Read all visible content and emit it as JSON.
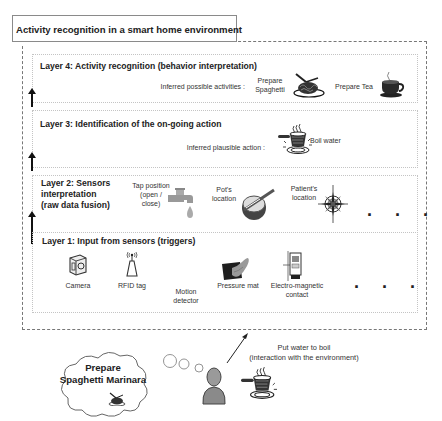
{
  "title": "Activity recognition in a smart home environment",
  "layers": [
    {
      "id": 4,
      "title": "Layer 4: Activity recognition (behavior interpretation)",
      "inferred_label": "Inferred possible activities :",
      "items": [
        {
          "label": "Prepare Spaghetti",
          "line1": "Prepare",
          "line2": "Spaghetti",
          "icon": "spaghetti-plate-icon"
        },
        {
          "label": "Prepare Tea",
          "icon": "tea-cup-icon"
        }
      ]
    },
    {
      "id": 3,
      "title": "Layer 3: Identification of the on-going action",
      "inferred_label": "Inferred plausible action :",
      "items": [
        {
          "label": "Boil water",
          "icon": "boiling-pot-icon"
        }
      ]
    },
    {
      "id": 2,
      "title_lines": [
        "Layer 2: Sensors",
        "interpretation",
        "(raw data fusion)"
      ],
      "items": [
        {
          "lines": [
            "Tap position",
            "(open /",
            "close)"
          ],
          "icon": "tap-icon"
        },
        {
          "lines": [
            "Pot's",
            "location"
          ],
          "icon": "pot-location-icon"
        },
        {
          "lines": [
            "Patient's",
            "location"
          ],
          "icon": "compass-icon"
        }
      ],
      "more": ". . ."
    },
    {
      "id": 1,
      "title": "Layer 1: Input from sensors (triggers)",
      "items": [
        {
          "lines": [
            "Camera"
          ],
          "icon": "camera-icon"
        },
        {
          "lines": [
            "RFID tag"
          ],
          "icon": "rfid-tag-icon"
        },
        {
          "lines": [
            "Motion",
            "detector"
          ],
          "icon": null
        },
        {
          "lines": [
            "Pressure mat"
          ],
          "icon": "pressure-mat-icon"
        },
        {
          "lines": [
            "Electro-magnetic",
            "contact"
          ],
          "icon": "electromagnetic-contact-icon"
        }
      ],
      "more": ". . ."
    }
  ],
  "bottom": {
    "thought_lines": [
      "Prepare",
      "Spaghetti Marinara"
    ],
    "action_lines": [
      "Put water to boil",
      "(interaction with the environment)"
    ]
  },
  "colors": {
    "border": "#8a8a8a",
    "dashed": "#777777",
    "dotted": "#c4c4c4",
    "text": "#222222"
  }
}
